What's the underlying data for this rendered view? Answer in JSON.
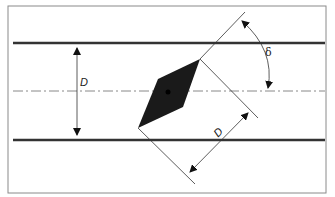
{
  "diagram": {
    "labels": {
      "pipe_diameter": "D",
      "blade_diameter": "D",
      "angle": "δ"
    },
    "colors": {
      "frame": "#8a8a8a",
      "wall": "#333333",
      "centerline": "#888888",
      "blade": "#1a1a1a",
      "construction": "#333333"
    }
  }
}
